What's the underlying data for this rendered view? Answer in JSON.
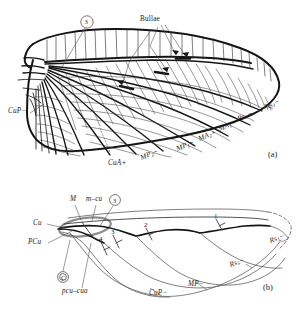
{
  "figure": {
    "panels": [
      {
        "id": "panel-a",
        "caption": "(a)",
        "description": "Detailed fore wing with reticulate cross-venation, bullae and named longitudinal veins"
      },
      {
        "id": "panel-b",
        "caption": "(b)",
        "description": "Schematic vein diagram of the same wing showing basal vein fusions and numbered sectors"
      }
    ],
    "ink_color": "#151515",
    "highlight_color": "#8d8d8d",
    "background_color": "#ffffff"
  },
  "panel_a": {
    "caption": "(a)",
    "callouts": [
      {
        "name": "bullae",
        "text": "Bullae",
        "italic": false
      },
      {
        "name": "circled-three",
        "text": "3"
      }
    ],
    "vein_labels": [
      {
        "name": "cup-minus",
        "base": "CuP",
        "sign": "−"
      },
      {
        "name": "cua-plus",
        "base": "CuA",
        "sign": "+"
      },
      {
        "name": "mp2-minus",
        "base": "MP",
        "subscript": "2",
        "sign": "−"
      },
      {
        "name": "mp1-minus",
        "base": "MP",
        "subscript": "1",
        "sign": "−"
      },
      {
        "name": "ma2-plus",
        "base": "MA",
        "subscript": "2",
        "sign": "+"
      },
      {
        "name": "ma1-plus",
        "base": "MA",
        "subscript": "1",
        "sign": "+"
      },
      {
        "name": "rs3-minus",
        "base": "Rs",
        "subscript": "3",
        "sign": "−"
      },
      {
        "name": "rs1-minus",
        "base": "Rs",
        "subscript": "1",
        "sign": "−"
      }
    ]
  },
  "panel_b": {
    "caption": "(b)",
    "vein_labels": [
      {
        "name": "m-label",
        "text": "M",
        "italic": true
      },
      {
        "name": "m-cu-label",
        "text": "m–cu",
        "italic": true
      },
      {
        "name": "cu-label",
        "text": "Cu",
        "italic": true
      },
      {
        "name": "pcu-label",
        "text": "PCu",
        "italic": true
      },
      {
        "name": "pcu-cua-label",
        "text": "pcu–cua",
        "italic": true
      },
      {
        "name": "cup-label",
        "base": "CuP",
        "sign": "−"
      },
      {
        "name": "mp-label",
        "base": "MP",
        "sign": "−"
      },
      {
        "name": "rs5-label",
        "base": "Rs",
        "subscript": "5",
        "sign": "−"
      },
      {
        "name": "rs1-label",
        "base": "Rs",
        "subscript": "1",
        "sign": "−"
      }
    ],
    "circled_markers": [
      {
        "name": "circled-three",
        "text": "3"
      },
      {
        "name": "circled-c",
        "text": "C"
      }
    ],
    "sector_numbers": [
      {
        "name": "sector-1",
        "text": "1"
      },
      {
        "name": "sector-2",
        "text": "2"
      },
      {
        "name": "sector-3",
        "text": "3"
      },
      {
        "name": "sector-4",
        "text": "4"
      }
    ]
  }
}
